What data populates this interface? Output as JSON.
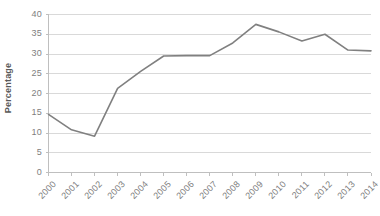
{
  "chart_data": {
    "type": "line",
    "title": "",
    "xlabel": "",
    "ylabel": "Percentage",
    "categories": [
      "2000",
      "2001",
      "2002",
      "2003",
      "2004",
      "2005",
      "2006",
      "2007",
      "2008",
      "2009",
      "2010",
      "2011",
      "2012",
      "2013",
      "2014"
    ],
    "series": [
      {
        "name": "Percentage",
        "values": [
          14.7,
          10.8,
          9.2,
          21.3,
          25.6,
          29.5,
          29.6,
          29.6,
          32.8,
          37.5,
          35.6,
          33.3,
          35.0,
          31.0,
          30.8
        ],
        "color": "#808080"
      }
    ],
    "ylim": [
      0,
      40
    ],
    "yticks": [
      0,
      5,
      10,
      15,
      20,
      25,
      30,
      35,
      40
    ],
    "ytick_labels": [
      "0",
      "5",
      "10",
      "15",
      "20",
      "25",
      "30",
      "35",
      "40"
    ],
    "grid": "horizontal",
    "gridline_color": "#d9d9d9",
    "axis_color": "#bfbfbf",
    "tick_label_color": "#808080",
    "legend": "none",
    "xtick_rotation": -45,
    "background": "#ffffff"
  }
}
